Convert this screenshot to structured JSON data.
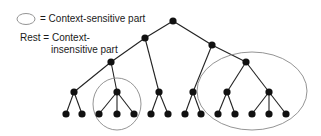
{
  "legend": {
    "ellipse_label": "= Context-sensitive part",
    "rest_line1": "Rest = Context-",
    "rest_line2": "insensitive part"
  },
  "tree": {
    "nodes": [
      {
        "id": "root"
      },
      {
        "id": "a",
        "parent": "root"
      },
      {
        "id": "b",
        "parent": "root"
      },
      {
        "id": "a1",
        "parent": "a"
      },
      {
        "id": "a2",
        "parent": "a"
      },
      {
        "id": "b1",
        "parent": "b"
      },
      {
        "id": "b2",
        "parent": "b"
      },
      {
        "id": "a1x",
        "parent": "a1"
      },
      {
        "id": "a1y",
        "parent": "a1"
      },
      {
        "id": "a1x1",
        "parent": "a1x"
      },
      {
        "id": "a1x2",
        "parent": "a1x"
      },
      {
        "id": "a1y1",
        "parent": "a1y"
      },
      {
        "id": "a1y2",
        "parent": "a1y"
      },
      {
        "id": "a1y3",
        "parent": "a1y"
      },
      {
        "id": "a2x",
        "parent": "a2"
      },
      {
        "id": "a2x1",
        "parent": "a2x"
      },
      {
        "id": "a2x2",
        "parent": "a2x"
      },
      {
        "id": "b1x",
        "parent": "b1"
      },
      {
        "id": "b1x1",
        "parent": "b1x"
      },
      {
        "id": "b1x2",
        "parent": "b1x"
      },
      {
        "id": "b2x",
        "parent": "b2"
      },
      {
        "id": "b2y",
        "parent": "b2"
      },
      {
        "id": "b2x1",
        "parent": "b2x"
      },
      {
        "id": "b2x2",
        "parent": "b2x"
      },
      {
        "id": "b2y1",
        "parent": "b2y"
      },
      {
        "id": "b2y2",
        "parent": "b2y"
      },
      {
        "id": "b2y3",
        "parent": "b2y"
      }
    ],
    "context_sensitive_regions": [
      "a1y",
      "b2"
    ]
  },
  "colors": {
    "node": "#111111",
    "edge": "#222222",
    "region": "#888888"
  }
}
